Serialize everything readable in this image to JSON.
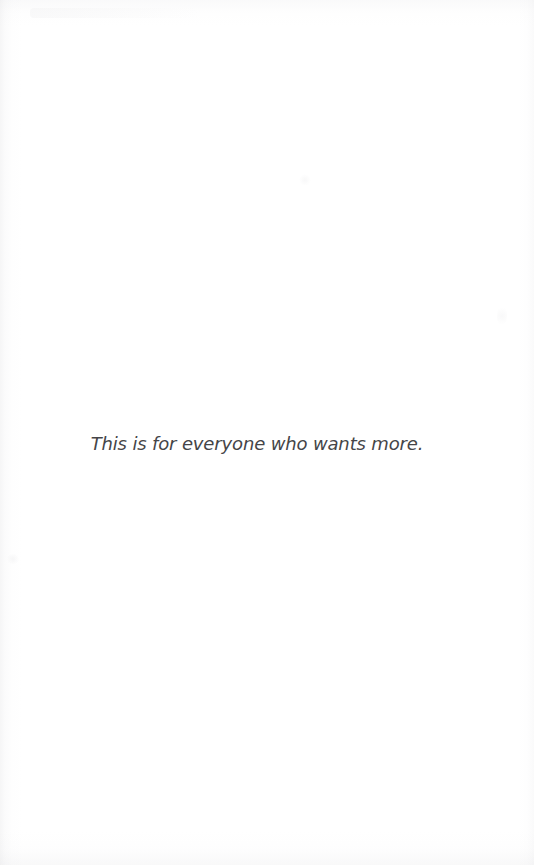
{
  "document": {
    "type": "book-dedication-page",
    "page_background_color": "#ffffff",
    "dedication": {
      "text": "This is for everyone who wants more.",
      "style": "italic",
      "text_color": "#454548",
      "alignment": "center"
    },
    "artifacts": {
      "edge_shadow_color": "#c4c4c8",
      "description": "faint scanner shadow and paper mottling along page edges"
    }
  }
}
